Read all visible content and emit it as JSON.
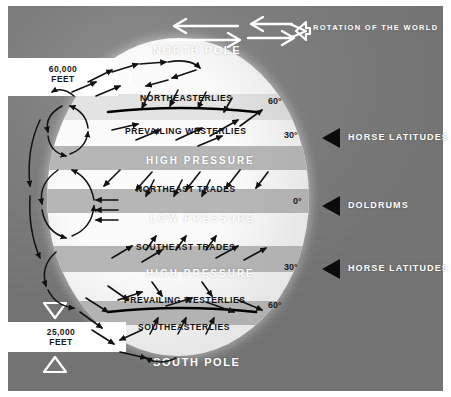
{
  "diagram": {
    "poles": {
      "north": "NORTH POLE",
      "south": "SOUTH POLE"
    },
    "rotation_label": "ROTATION OF THE WORLD",
    "altitude_markers": [
      {
        "name": "upper",
        "value": "60,000\nFEET"
      },
      {
        "name": "lower",
        "value": "25,000\nFEET"
      }
    ],
    "wind_bands": [
      {
        "id": "northeasterlies",
        "label": "NORTHEASTERLIES",
        "style": "dark",
        "hemisphere": "north"
      },
      {
        "id": "prevailing-westerlies-n",
        "label": "PREVAILING  WESTERLIES",
        "style": "dark",
        "hemisphere": "north"
      },
      {
        "id": "high-pressure-north",
        "label": "HIGH  PRESSURE",
        "style": "white",
        "hemisphere": "north"
      },
      {
        "id": "northeast-trades",
        "label": "NORTHEAST  TRADES",
        "style": "dark",
        "hemisphere": "north"
      },
      {
        "id": "low-pressure",
        "label": "LOW  PRESSURE",
        "style": "white",
        "hemisphere": "equator"
      },
      {
        "id": "southeast-trades",
        "label": "SOUTHEAST  TRADES",
        "style": "dark",
        "hemisphere": "south"
      },
      {
        "id": "high-pressure-south",
        "label": "HIGH  PRESSURE",
        "style": "white",
        "hemisphere": "south"
      },
      {
        "id": "prevailing-westerlies-s",
        "label": "PREVAILING  WESTERLIES",
        "style": "dark",
        "hemisphere": "south"
      },
      {
        "id": "southeasterlies",
        "label": "SOUTHEASTERLIES",
        "style": "dark",
        "hemisphere": "south"
      }
    ],
    "latitudes": [
      {
        "id": "60n",
        "label": "60°"
      },
      {
        "id": "30n",
        "label": "30°"
      },
      {
        "id": "0",
        "label": "0°"
      },
      {
        "id": "30s",
        "label": "30°"
      },
      {
        "id": "60s",
        "label": "60°"
      }
    ],
    "callouts": [
      {
        "id": "horse-latitudes-north",
        "label": "HORSE  LATITUDES"
      },
      {
        "id": "doldrums",
        "label": "DOLDRUMS"
      },
      {
        "id": "horse-latitudes-south",
        "label": "HORSE  LATITUDES"
      }
    ],
    "colors": {
      "background_grey": "#7d7d7d",
      "globe_white": "#fbfbfb",
      "band_grey": "#b6b6b6",
      "band_pale": "#e3e3e3",
      "ink_black": "#111111",
      "label_white": "#ffffff"
    }
  }
}
